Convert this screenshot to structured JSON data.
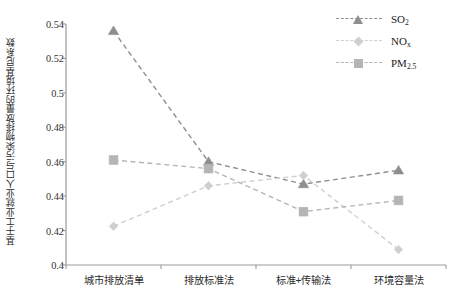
{
  "chart_data": {
    "type": "line",
    "title": "",
    "xlabel": "",
    "ylabel": "基于工业就业人口与污染物排放量的环境基尼系数",
    "categories": [
      "城市排放清单",
      "排放标准法",
      "标准+传输法",
      "环境容量法"
    ],
    "ylim": [
      0.4,
      0.54
    ],
    "yticks": [
      "0.4",
      "0.42",
      "0.44",
      "0.46",
      "0.48",
      "0.5",
      "0.52",
      "0.54"
    ],
    "ytick_values": [
      0.4,
      0.42,
      0.44,
      0.46,
      0.48,
      0.5,
      0.52,
      0.54
    ],
    "grid": false,
    "legend_position": "top-right",
    "series": [
      {
        "name": "SO2",
        "label_main": "SO",
        "label_sub": "2",
        "marker": "triangle",
        "color": "#8e8e8e",
        "linestyle": "dashed",
        "values": [
          0.536,
          0.46,
          0.447,
          0.455
        ]
      },
      {
        "name": "NOx",
        "label_main": "NO",
        "label_sub": "x",
        "marker": "diamond",
        "color": "#cfcfcf",
        "linestyle": "dashed",
        "values": [
          0.4225,
          0.446,
          0.452,
          0.409
        ]
      },
      {
        "name": "PM2.5",
        "label_main": "PM",
        "label_sub": "2.5",
        "marker": "square",
        "color": "#b5b5b5",
        "linestyle": "dashed",
        "values": [
          0.461,
          0.456,
          0.431,
          0.4375
        ]
      }
    ]
  },
  "colors": {
    "axis": "#9a9a9a",
    "text": "#2b2b2b",
    "background": "#ffffff",
    "so2": "#8e8e8e",
    "nox": "#cfcfcf",
    "pm25": "#b5b5b5"
  }
}
